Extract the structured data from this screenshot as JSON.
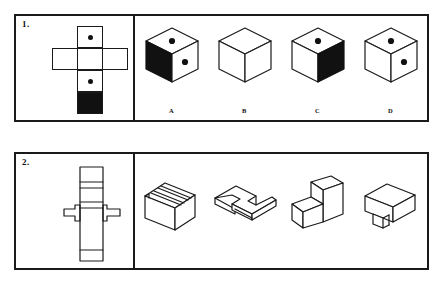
{
  "document": {
    "type": "spatial-reasoning-test-worksheet",
    "background_color": "#ffffff",
    "ink_color": "#111111"
  },
  "questions": [
    {
      "number": "1.",
      "prompt": {
        "name": "dice-net",
        "description": "Cross shaped net of a cube with two dots and one black square",
        "cells": [
          {
            "id": "top",
            "row": 0,
            "col": 1,
            "fill": "white",
            "pips": 1
          },
          {
            "id": "left-arm",
            "row": 1,
            "col": 0,
            "fill": "white",
            "pips": 0
          },
          {
            "id": "center",
            "row": 1,
            "col": 1,
            "fill": "white",
            "pips": 0
          },
          {
            "id": "right-arm",
            "row": 1,
            "col": 2,
            "fill": "white",
            "pips": 0
          },
          {
            "id": "lower",
            "row": 2,
            "col": 1,
            "fill": "white",
            "pips": 1
          },
          {
            "id": "bottom",
            "row": 3,
            "col": 1,
            "fill": "black",
            "pips": 0
          }
        ]
      },
      "options": [
        {
          "label": "A",
          "name": "cube-option-a",
          "top_face": {
            "fill": "white",
            "pips": 1
          },
          "left_face": {
            "fill": "black",
            "pips": 0
          },
          "right_face": {
            "fill": "white",
            "pips": 1
          }
        },
        {
          "label": "B",
          "name": "cube-option-b",
          "top_face": {
            "fill": "white",
            "pips": 0
          },
          "left_face": {
            "fill": "white",
            "pips": 0
          },
          "right_face": {
            "fill": "white",
            "pips": 0
          }
        },
        {
          "label": "C",
          "name": "cube-option-c",
          "top_face": {
            "fill": "white",
            "pips": 1
          },
          "left_face": {
            "fill": "white",
            "pips": 0
          },
          "right_face": {
            "fill": "black",
            "pips": 0
          }
        },
        {
          "label": "D",
          "name": "cube-option-d",
          "top_face": {
            "fill": "white",
            "pips": 1
          },
          "left_face": {
            "fill": "white",
            "pips": 0
          },
          "right_face": {
            "fill": "white",
            "pips": 1
          }
        }
      ]
    },
    {
      "number": "2.",
      "prompt": {
        "name": "stepped-block-net",
        "description": "Vertical strip of six segments crossed by a horizontal band with small tabs at both ends"
      },
      "options": [
        {
          "label": "",
          "name": "solid-option-a",
          "description": "Block with two parallel grooves across the top face"
        },
        {
          "label": "",
          "name": "solid-option-b",
          "description": "Flat stepped plate seen from above with notch"
        },
        {
          "label": "",
          "name": "solid-option-c",
          "description": "Two level staircase block"
        },
        {
          "label": "",
          "name": "solid-option-d",
          "description": "Block with a small notch cut from the bottom front edge"
        }
      ]
    }
  ]
}
